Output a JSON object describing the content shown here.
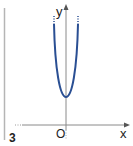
{
  "figure": {
    "number": "3",
    "axes": {
      "x_label": "x",
      "y_label": "y",
      "origin_label": "O"
    },
    "curve": {
      "type": "parabola",
      "opens": "up",
      "vertex_above_x_axis": true,
      "color": "#2a4f93"
    },
    "colors": {
      "axis": "#9a9a9a",
      "margin_line": "#b0b0b0",
      "text": "#222222"
    }
  }
}
